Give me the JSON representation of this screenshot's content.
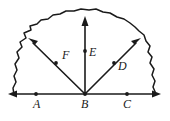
{
  "figure": {
    "background_color": "#ffffff",
    "ink_color": "#1a1a1a",
    "width": 170,
    "height": 121
  },
  "points": [
    {
      "id": "A",
      "label": "A",
      "x": 36,
      "y": 94,
      "label_x": 33,
      "label_y": 108,
      "on": "baseline"
    },
    {
      "id": "B",
      "label": "B",
      "x": 85,
      "y": 94,
      "label_x": 81,
      "label_y": 108,
      "on": "baseline"
    },
    {
      "id": "C",
      "label": "C",
      "x": 127,
      "y": 94,
      "label_x": 123,
      "label_y": 108,
      "on": "baseline"
    },
    {
      "id": "D",
      "label": "D",
      "x": 114,
      "y": 63,
      "label_x": 118,
      "label_y": 70,
      "on": "ray-right"
    },
    {
      "id": "E",
      "label": "E",
      "x": 85,
      "y": 51,
      "label_x": 89,
      "label_y": 56,
      "on": "ray-up"
    },
    {
      "id": "F",
      "label": "F",
      "x": 56,
      "y": 63,
      "label_x": 62,
      "label_y": 59,
      "on": "ray-left"
    }
  ],
  "rays": [
    {
      "id": "ray-left",
      "name": "ray-B-to-F",
      "from": "B",
      "x1": 85,
      "y1": 94,
      "x2": 29,
      "y2": 39,
      "arrow": "end"
    },
    {
      "id": "ray-up",
      "name": "ray-B-to-E",
      "from": "B",
      "x1": 85,
      "y1": 94,
      "x2": 85,
      "y2": 17,
      "arrow": "end"
    },
    {
      "id": "ray-right",
      "name": "ray-B-to-D",
      "from": "B",
      "x1": 85,
      "y1": 94,
      "x2": 140,
      "y2": 39,
      "arrow": "end"
    }
  ],
  "baseline": {
    "name": "line-A-B-C",
    "x1": 9,
    "y1": 94,
    "x2": 160,
    "y2": 94,
    "arrow": "both"
  },
  "region": {
    "name": "irregular-closed-region",
    "description": "rough hand-drawn wavy dome boundary resting on the baseline",
    "path": "M 14,95 L 13,88 L 16,82 L 14,76 L 17,70 L 15,64 L 19,58 L 17,52 L 22,47 L 20,42 L 26,38 L 24,33 L 31,30 L 30,26 L 37,24 L 41,20 L 48,19 L 53,15 L 60,14 L 66,11 L 74,11 L 81,9 L 89,10 L 96,9 L 103,12 L 110,13 L 117,17 L 124,19 L 130,23 L 135,27 L 139,31 L 144,35 L 146,41 L 150,46 L 148,52 L 152,57 L 150,63 L 154,69 L 152,75 L 155,81 L 153,87 L 156,94"
  }
}
